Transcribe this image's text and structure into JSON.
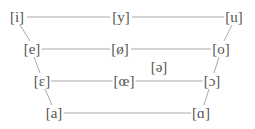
{
  "diagram": {
    "title": "",
    "line_color": "#aaaaaa",
    "text_color": "#555555",
    "vowels": [
      {
        "id": "i",
        "label": "[i]",
        "x": 17,
        "y": 17
      },
      {
        "id": "y",
        "label": "[y]",
        "x": 121,
        "y": 17
      },
      {
        "id": "u",
        "label": "[u]",
        "x": 234,
        "y": 17
      },
      {
        "id": "e",
        "label": "[e]",
        "x": 32,
        "y": 49
      },
      {
        "id": "oe-slash",
        "label": "[ø]",
        "x": 120,
        "y": 49
      },
      {
        "id": "o",
        "label": "[o]",
        "x": 221,
        "y": 49
      },
      {
        "id": "schwa",
        "label": "[ə]",
        "x": 159,
        "y": 67
      },
      {
        "id": "open-e",
        "label": "[ɛ]",
        "x": 42,
        "y": 81
      },
      {
        "id": "oe",
        "label": "[œ]",
        "x": 124,
        "y": 81
      },
      {
        "id": "open-o",
        "label": "[ɔ]",
        "x": 212,
        "y": 81
      },
      {
        "id": "a",
        "label": "[a]",
        "x": 54,
        "y": 113
      },
      {
        "id": "script-a",
        "label": "[ɑ]",
        "x": 201,
        "y": 113
      }
    ]
  }
}
